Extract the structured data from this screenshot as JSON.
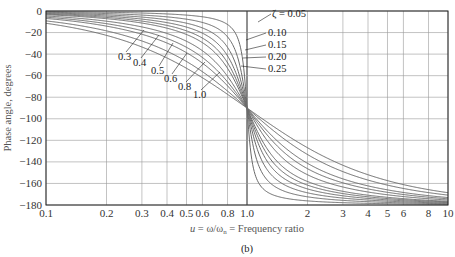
{
  "chart_data": {
    "type": "line",
    "title": "",
    "caption": "(b)",
    "xlabel": "u = ω/ωn = Frequency ratio",
    "ylabel": "Phase angle, degrees",
    "xscale": "log",
    "xlim": [
      0.1,
      10
    ],
    "ylim": [
      -180,
      0
    ],
    "grid": true,
    "x_ticks": [
      0.1,
      0.2,
      0.3,
      0.4,
      0.5,
      0.6,
      0.8,
      1.0,
      2,
      3,
      4,
      5,
      6,
      8,
      10
    ],
    "x_tick_labels": [
      "0.1",
      "0.2",
      "0.3",
      "0.4",
      "0.5",
      "0.6",
      "0.8",
      "1.0",
      "2",
      "3",
      "4",
      "5",
      "6",
      "8",
      "10"
    ],
    "y_ticks": [
      0,
      -20,
      -40,
      -60,
      -80,
      -100,
      -120,
      -140,
      -160,
      -180
    ],
    "y_tick_labels": [
      "0",
      "−20",
      "−40",
      "−60",
      "−80",
      "−100",
      "−120",
      "−140",
      "−160",
      "−180"
    ],
    "formula": "phase = -atan2(2*zeta*u, 1 - u^2) in degrees",
    "series": [
      {
        "name": "ζ = 0.05",
        "zeta": 0.05,
        "x": [
          0.1,
          0.5,
          0.8,
          0.9,
          1.0,
          1.1,
          1.25,
          2,
          10
        ],
        "values": [
          -0.6,
          -3.8,
          -8.9,
          -25.3,
          -90,
          -152.4,
          -170.1,
          -176.2,
          -179.4
        ]
      },
      {
        "name": "0.10",
        "zeta": 0.1,
        "x": [
          0.1,
          0.5,
          0.8,
          1.0,
          1.25,
          2,
          10
        ],
        "values": [
          -1.2,
          -7.6,
          -17.4,
          -90,
          -160.6,
          -172.4,
          -178.8
        ]
      },
      {
        "name": "0.15",
        "zeta": 0.15,
        "x": [
          0.1,
          0.5,
          0.8,
          1.0,
          1.25,
          2,
          10
        ],
        "values": [
          -1.7,
          -11.3,
          -25.6,
          -90,
          -151.9,
          -168.7,
          -178.3
        ]
      },
      {
        "name": "0.20",
        "zeta": 0.2,
        "x": [
          0.1,
          0.5,
          0.8,
          1.0,
          1.25,
          2,
          10
        ],
        "values": [
          -2.3,
          -14.9,
          -33.7,
          -90,
          -144.1,
          -165.1,
          -177.7
        ]
      },
      {
        "name": "0.25",
        "zeta": 0.25,
        "x": [
          0.1,
          0.5,
          0.8,
          1.0,
          1.25,
          2,
          10
        ],
        "values": [
          -2.9,
          -18.4,
          -41.6,
          -90,
          -137.5,
          -161.6,
          -177.1
        ]
      },
      {
        "name": "0.3",
        "zeta": 0.3,
        "x": [
          0.1,
          0.5,
          0.8,
          1.0,
          2,
          10
        ],
        "values": [
          -3.5,
          -21.8,
          -53.1,
          -90,
          -158.2,
          -176.5
        ]
      },
      {
        "name": "0.4",
        "zeta": 0.4,
        "x": [
          0.1,
          0.5,
          0.8,
          1.0,
          2,
          10
        ],
        "values": [
          -4.6,
          -28.1,
          -60.6,
          -90,
          -151.9,
          -175.4
        ]
      },
      {
        "name": "0.5",
        "zeta": 0.5,
        "x": [
          0.1,
          0.5,
          0.8,
          1.0,
          2,
          10
        ],
        "values": [
          -5.8,
          -33.7,
          -65.8,
          -90,
          -146.3,
          -174.2
        ]
      },
      {
        "name": "0.6",
        "zeta": 0.6,
        "x": [
          0.1,
          0.5,
          0.8,
          1.0,
          2,
          10
        ],
        "values": [
          -6.9,
          -38.7,
          -69.4,
          -90,
          -141.3,
          -173.1
        ]
      },
      {
        "name": "0.8",
        "zeta": 0.8,
        "x": [
          0.1,
          0.5,
          0.8,
          1.0,
          2,
          10
        ],
        "values": [
          -9.2,
          -46.8,
          -74.2,
          -90,
          -133.2,
          -170.8
        ]
      },
      {
        "name": "1.0",
        "zeta": 1.0,
        "x": [
          0.1,
          0.5,
          0.8,
          1.0,
          2,
          10
        ],
        "values": [
          -11.4,
          -53.1,
          -77.3,
          -90,
          -126.9,
          -168.6
        ]
      }
    ],
    "annotations": [
      {
        "text": "ζ = 0.05",
        "position": "upper right near u=1"
      },
      {
        "text": "0.10"
      },
      {
        "text": "0.15"
      },
      {
        "text": "0.20"
      },
      {
        "text": "0.25"
      },
      {
        "text": "0.3"
      },
      {
        "text": "0.4"
      },
      {
        "text": "0.5"
      },
      {
        "text": "0.6"
      },
      {
        "text": "0.8"
      },
      {
        "text": "1.0"
      }
    ]
  },
  "labels": {
    "ylabel": "Phase angle, degrees",
    "xlabel_u": "u",
    "xlabel_rest": " = ω/ω",
    "xlabel_sub": "n",
    "xlabel_tail": " = Frequency ratio",
    "caption": "(b)",
    "zeta_top": "ζ = 0.05",
    "zeta_right": [
      "0.10",
      "0.15",
      "0.20",
      "0.25"
    ],
    "zeta_left": [
      "0.3",
      "0.4",
      "0.5",
      "0.6",
      "0.8",
      "1.0"
    ]
  },
  "colors": {
    "curve": "#6a6a6a",
    "grid": "#9a9a9a",
    "axis": "#222222"
  }
}
